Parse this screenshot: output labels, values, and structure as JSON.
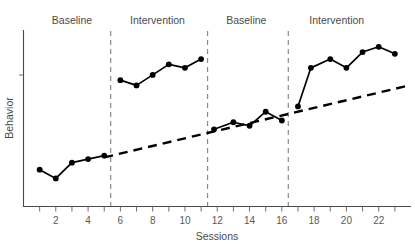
{
  "chart_data": {
    "type": "line",
    "title": "",
    "xlabel": "Sessions",
    "ylabel": "Behavior",
    "xlim": [
      0,
      24
    ],
    "ylim": [
      0,
      100
    ],
    "grid": false,
    "legend": "none",
    "x_tick_labels": [
      "2",
      "4",
      "6",
      "8",
      "10",
      "12",
      "14",
      "16",
      "18",
      "20",
      "22"
    ],
    "x_tick_values": [
      2,
      4,
      6,
      8,
      10,
      12,
      14,
      16,
      18,
      20,
      22
    ],
    "x_minor_ticks": [
      1,
      2,
      3,
      4,
      5,
      6,
      7,
      8,
      9,
      10,
      11,
      12,
      13,
      14,
      15,
      16,
      17,
      18,
      19,
      20,
      21,
      22,
      23
    ],
    "y_tick_labels": [],
    "phase_labels": [
      {
        "text": "Baseline",
        "x_center": 3.0
      },
      {
        "text": "Intervention",
        "x_center": 8.3
      },
      {
        "text": "Baseline",
        "x_center": 13.8
      },
      {
        "text": "Intervention",
        "x_center": 19.4
      }
    ],
    "phase_dividers": [
      5.4,
      11.4,
      16.4
    ],
    "series": [
      {
        "name": "Baseline 1",
        "x": [
          1,
          2,
          3,
          4,
          5
        ],
        "values": [
          21,
          16,
          25,
          27,
          29
        ]
      },
      {
        "name": "Intervention 1",
        "x": [
          6,
          7,
          8,
          9,
          10,
          11
        ],
        "values": [
          72,
          69,
          75,
          81,
          79,
          84
        ]
      },
      {
        "name": "Baseline 2",
        "x": [
          11.8,
          13,
          14,
          15,
          16
        ],
        "values": [
          44,
          48,
          46,
          54,
          49
        ]
      },
      {
        "name": "Intervention 2",
        "x": [
          17,
          17.8,
          19,
          20,
          21,
          22,
          23
        ],
        "values": [
          57,
          79,
          84,
          79,
          88,
          91,
          87
        ]
      }
    ],
    "trend_line": {
      "name": "Projected baseline trend",
      "style": "dashed",
      "x_start": 5.0,
      "y_start": 28,
      "x_end": 23.9,
      "y_end": 69
    }
  }
}
